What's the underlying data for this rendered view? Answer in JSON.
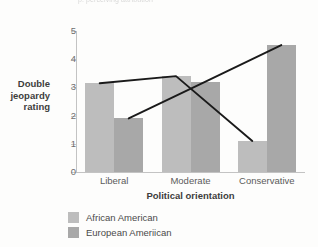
{
  "page": {
    "top_fragment": "p. perceiving attribution"
  },
  "chart_data": {
    "type": "bar",
    "title": "",
    "xlabel": "Political orientation",
    "ylabel": "Double jeopardy rating",
    "ylabel_lines": [
      "Double",
      "jeopardy",
      "rating"
    ],
    "categories": [
      "Liberal",
      "Moderate",
      "Conservative"
    ],
    "series": [
      {
        "name": "African American",
        "color": "#bdbdbd",
        "values": [
          3.15,
          3.4,
          1.1
        ]
      },
      {
        "name": "European Ameriican",
        "color": "#a8a8a8",
        "values": [
          1.9,
          3.2,
          4.5
        ]
      }
    ],
    "ylim": [
      0,
      5
    ],
    "ytick_labels": [
      "5",
      "4",
      "3",
      "2",
      "1",
      "0"
    ],
    "ytick_values": [
      5,
      4,
      3,
      2,
      1,
      0
    ],
    "grid": false,
    "legend_position": "bottom-left",
    "overlay_lines": [
      {
        "name": "african-american-trend",
        "series_index": 0,
        "values": [
          3.15,
          3.4,
          1.1
        ],
        "color": "#1a1a1a"
      },
      {
        "name": "european-american-trend",
        "series_index": 1,
        "values": [
          1.9,
          3.2,
          4.5
        ],
        "color": "#1a1a1a"
      }
    ]
  }
}
